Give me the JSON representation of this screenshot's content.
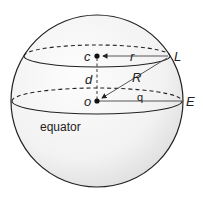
{
  "diagram": {
    "labels": {
      "center_of_latitude_circle": "c",
      "sphere_center": "o",
      "latitude_point": "L",
      "equator_point": "E",
      "latitude_radius": "r",
      "sphere_radius": "R",
      "distance_between_centers": "d",
      "angle": "q",
      "equator": "equator"
    },
    "geometry": {
      "sphere": {
        "cx": 97,
        "cy": 101,
        "r": 86
      },
      "equator_ellipse": {
        "cx": 97,
        "cy": 101,
        "rx": 85,
        "ry": 13
      },
      "latitude_ellipse": {
        "cx": 97,
        "cy": 56,
        "rx": 73,
        "ry": 11
      },
      "points": {
        "c": [
          97,
          56
        ],
        "o": [
          97,
          101
        ],
        "L": [
          170,
          56
        ],
        "E": [
          183,
          101
        ]
      }
    },
    "colors": {
      "stroke": "#222222",
      "sphere_fill_light": "#fbfbfb",
      "sphere_fill_dark": "#e4e4e4"
    }
  }
}
